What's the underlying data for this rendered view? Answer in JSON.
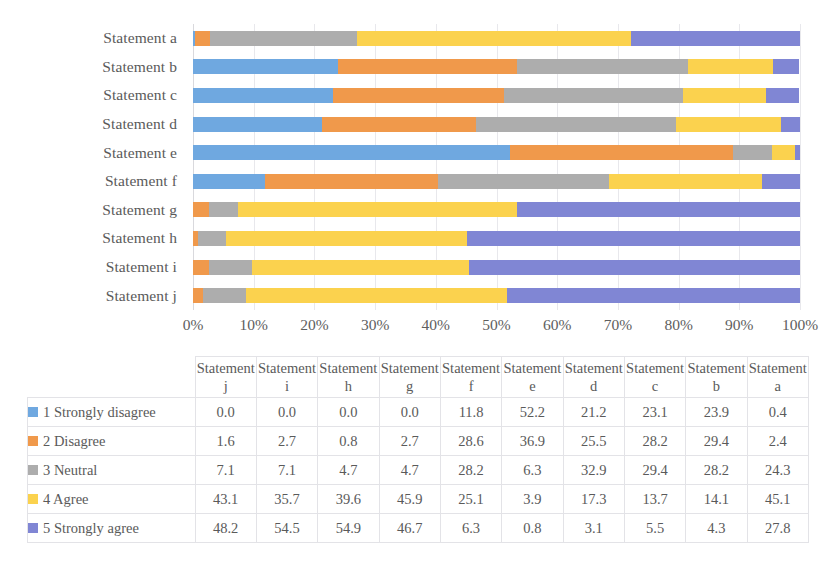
{
  "chart_data": {
    "type": "bar",
    "subtype": "100% stacked horizontal bar",
    "title": "",
    "xlabel": "",
    "ylabel": "",
    "xlim": [
      0,
      100
    ],
    "grid": true,
    "legend_position": "table-row-headers",
    "categories": [
      "Statement a",
      "Statement b",
      "Statement c",
      "Statement d",
      "Statement e",
      "Statement f",
      "Statement g",
      "Statement h",
      "Statement i",
      "Statement j"
    ],
    "x_tick_labels": [
      "0%",
      "10%",
      "20%",
      "30%",
      "40%",
      "50%",
      "60%",
      "70%",
      "80%",
      "90%",
      "100%"
    ],
    "x_tick_values": [
      0,
      10,
      20,
      30,
      40,
      50,
      60,
      70,
      80,
      90,
      100
    ],
    "series": [
      {
        "name": "1 Strongly disagree",
        "color": "#6FA8E0",
        "values_by_category": {
          "Statement a": 0.4,
          "Statement b": 23.9,
          "Statement c": 23.1,
          "Statement d": 21.2,
          "Statement e": 52.2,
          "Statement f": 11.8,
          "Statement g": 0.0,
          "Statement h": 0.0,
          "Statement i": 0.0,
          "Statement j": 0.0
        }
      },
      {
        "name": "2 Disagree",
        "color": "#F0994B",
        "values_by_category": {
          "Statement a": 2.4,
          "Statement b": 29.4,
          "Statement c": 28.2,
          "Statement d": 25.5,
          "Statement e": 36.9,
          "Statement f": 28.6,
          "Statement g": 2.7,
          "Statement h": 0.8,
          "Statement i": 2.7,
          "Statement j": 1.6
        }
      },
      {
        "name": "3 Neutral",
        "color": "#ADADAD",
        "values_by_category": {
          "Statement a": 24.3,
          "Statement b": 28.2,
          "Statement c": 29.4,
          "Statement d": 32.9,
          "Statement e": 6.3,
          "Statement f": 28.2,
          "Statement g": 4.7,
          "Statement h": 4.7,
          "Statement i": 7.1,
          "Statement j": 7.1
        }
      },
      {
        "name": "4 Agree",
        "color": "#FBD24E",
        "values_by_category": {
          "Statement a": 45.1,
          "Statement b": 14.1,
          "Statement c": 13.7,
          "Statement d": 17.3,
          "Statement e": 3.9,
          "Statement f": 25.1,
          "Statement g": 45.9,
          "Statement h": 39.6,
          "Statement i": 35.7,
          "Statement j": 43.1
        }
      },
      {
        "name": "5 Strongly agree",
        "color": "#8086D4",
        "values_by_category": {
          "Statement a": 27.8,
          "Statement b": 4.3,
          "Statement c": 5.5,
          "Statement d": 3.1,
          "Statement e": 0.8,
          "Statement f": 6.3,
          "Statement g": 46.7,
          "Statement h": 54.9,
          "Statement i": 54.5,
          "Statement j": 48.2
        }
      }
    ]
  },
  "table": {
    "corner_label": "",
    "column_headers": [
      "Statement j",
      "Statement i",
      "Statement h",
      "Statement g",
      "Statement f",
      "Statement e",
      "Statement d",
      "Statement c",
      "Statement b",
      "Statement a"
    ],
    "rows": [
      {
        "label": "1 Strongly disagree",
        "color": "#6FA8E0",
        "values": [
          "0.0",
          "0.0",
          "0.0",
          "0.0",
          "11.8",
          "52.2",
          "21.2",
          "23.1",
          "23.9",
          "0.4"
        ]
      },
      {
        "label": "2 Disagree",
        "color": "#F0994B",
        "values": [
          "1.6",
          "2.7",
          "0.8",
          "2.7",
          "28.6",
          "36.9",
          "25.5",
          "28.2",
          "29.4",
          "2.4"
        ]
      },
      {
        "label": "3 Neutral",
        "color": "#ADADAD",
        "values": [
          "7.1",
          "7.1",
          "4.7",
          "4.7",
          "28.2",
          "6.3",
          "32.9",
          "29.4",
          "28.2",
          "24.3"
        ]
      },
      {
        "label": "4 Agree",
        "color": "#FBD24E",
        "values": [
          "43.1",
          "35.7",
          "39.6",
          "45.9",
          "25.1",
          "3.9",
          "17.3",
          "13.7",
          "14.1",
          "45.1"
        ]
      },
      {
        "label": "5 Strongly agree",
        "color": "#8086D4",
        "values": [
          "48.2",
          "54.5",
          "54.9",
          "46.7",
          "6.3",
          "0.8",
          "3.1",
          "5.5",
          "4.3",
          "27.8"
        ]
      }
    ]
  }
}
